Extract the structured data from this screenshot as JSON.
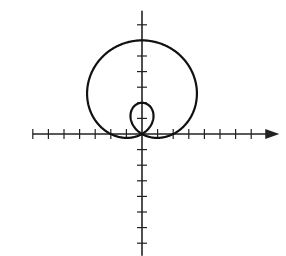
{
  "chart_data": {
    "type": "line",
    "title": "",
    "equation": "r = 2 + 4 sin(theta)",
    "a": 2,
    "b": 4,
    "xlabel": "",
    "ylabel": "",
    "xlim": [
      -7,
      8.8
    ],
    "ylim": [
      -7.8,
      7.9
    ],
    "x_ticks": [
      -7,
      -6,
      -5,
      -4,
      -3,
      -2,
      -1,
      1,
      2,
      3,
      4,
      5,
      6,
      7
    ],
    "y_ticks": [
      -7,
      -6,
      -5,
      -4,
      -3,
      -2,
      -1,
      1,
      2,
      3,
      4,
      5,
      6,
      7
    ],
    "tick_labels_shown": false,
    "grid": false,
    "x_axis_arrow": true,
    "key_points": [
      {
        "label": "outer loop top",
        "x": 0,
        "y": 6
      },
      {
        "label": "inner loop top",
        "x": 0,
        "y": 2
      },
      {
        "label": "pole",
        "x": 0,
        "y": 0
      }
    ]
  },
  "style": {
    "line_color": "#111111",
    "axis_color": "#222222",
    "background": "#ffffff"
  },
  "layout": {
    "origin_x": 142,
    "origin_y": 134,
    "unit_px": 15.6
  }
}
